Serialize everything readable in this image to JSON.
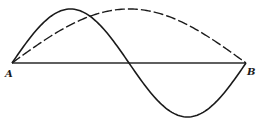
{
  "diagram": {
    "labels": {
      "start": "A",
      "end": "B"
    },
    "curves": [
      {
        "name": "fundamental",
        "style": "dashed",
        "half_wavelengths": 1,
        "amplitude_rel": 1.0,
        "phase_sign": 1
      },
      {
        "name": "second-harmonic",
        "style": "solid",
        "half_wavelengths": 2,
        "amplitude_rel": 1.0,
        "phase_sign": 1
      }
    ]
  }
}
